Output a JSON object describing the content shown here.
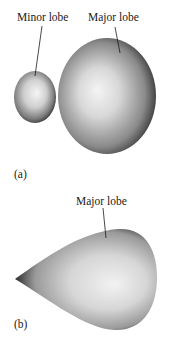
{
  "panel_a": {
    "tag": "(a)",
    "minor_lobe_label": "Minor lobe",
    "major_lobe_label": "Major lobe"
  },
  "panel_b": {
    "tag": "(b)",
    "major_lobe_label": "Major lobe"
  },
  "colors": {
    "lobe_highlight": "#f4f4f4",
    "lobe_shadow": "#1e1e1e",
    "leader_line": "#1a1a1a"
  }
}
